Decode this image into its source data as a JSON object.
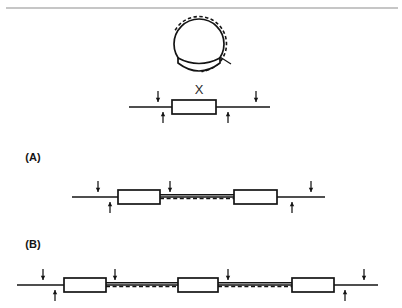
{
  "figure": {
    "title_rule_visible": true,
    "background_color": "#ffffff",
    "ink_color": "#141414",
    "rule_color": "#8d8d8d"
  },
  "panels": [
    {
      "id": "top",
      "label": "",
      "element_label": "X",
      "description": "circular donor molecule above a linear target strand carrying one inserted element"
    },
    {
      "id": "a",
      "label": "(A)",
      "description": "linear strand with two inserted elements joined by a duplex dashed segment"
    },
    {
      "id": "b",
      "label": "(B)",
      "description": "linear strand with three inserted elements joined by duplex dashed segments"
    }
  ],
  "labels": {
    "panel_a": "(A)",
    "panel_b": "(B)",
    "element_x": "X"
  },
  "chart_data": {
    "type": "diagram",
    "title": "",
    "top_rule": {
      "x1": 6,
      "x2": 398,
      "y": 8
    },
    "donor_circle": {
      "cx": 199,
      "cy": 44,
      "r_solid": 25,
      "r_dashed": 27.5,
      "dashed_arc_start_deg": -150,
      "dashed_arc_end_deg": 85,
      "nick_tick": {
        "x1": 220,
        "y1": 57,
        "x2": 231,
        "y2": 64
      },
      "crescent": {
        "left_x": 178,
        "right_x": 220,
        "top_y": 58,
        "bottom_y": 74
      }
    },
    "panels": [
      {
        "id": "top",
        "baseline_y": 107,
        "line_x1": 129,
        "line_x2": 270,
        "label": {
          "text": "X",
          "x": 199,
          "y": 94
        },
        "boxes": [
          {
            "x": 172,
            "y": 100,
            "w": 44,
            "h": 14
          }
        ],
        "duplex_segments": [],
        "arrows": [
          {
            "x": 158,
            "dir": "down",
            "side": "above"
          },
          {
            "x": 163,
            "dir": "up",
            "side": "below"
          },
          {
            "x": 228,
            "dir": "up",
            "side": "below"
          },
          {
            "x": 256,
            "dir": "down",
            "side": "above"
          }
        ]
      },
      {
        "id": "a",
        "baseline_y": 197,
        "line_x1": 72,
        "line_x2": 325,
        "label": {
          "text": "(A)",
          "x": 33,
          "y": 161
        },
        "boxes": [
          {
            "x": 118,
            "y": 190,
            "w": 42,
            "h": 14
          },
          {
            "x": 234,
            "y": 190,
            "w": 43,
            "h": 14
          }
        ],
        "duplex_segments": [
          {
            "x1": 160,
            "x2": 234
          }
        ],
        "arrows": [
          {
            "x": 98,
            "dir": "down",
            "side": "above"
          },
          {
            "x": 110,
            "dir": "up",
            "side": "below"
          },
          {
            "x": 170,
            "dir": "down",
            "side": "above"
          },
          {
            "x": 292,
            "dir": "up",
            "side": "below"
          },
          {
            "x": 311,
            "dir": "down",
            "side": "above"
          }
        ]
      },
      {
        "id": "b",
        "baseline_y": 285,
        "line_x1": 17,
        "line_x2": 378,
        "label": {
          "text": "(B)",
          "x": 33,
          "y": 248
        },
        "boxes": [
          {
            "x": 64,
            "y": 278,
            "w": 42,
            "h": 14
          },
          {
            "x": 178,
            "y": 278,
            "w": 40,
            "h": 14
          },
          {
            "x": 292,
            "y": 278,
            "w": 42,
            "h": 14
          }
        ],
        "duplex_segments": [
          {
            "x1": 106,
            "x2": 178
          },
          {
            "x1": 218,
            "x2": 292
          }
        ],
        "arrows": [
          {
            "x": 43,
            "dir": "down",
            "side": "above"
          },
          {
            "x": 55,
            "dir": "up",
            "side": "below"
          },
          {
            "x": 115,
            "dir": "down",
            "side": "above"
          },
          {
            "x": 228,
            "dir": "down",
            "side": "above"
          },
          {
            "x": 345,
            "dir": "up",
            "side": "below"
          },
          {
            "x": 364,
            "dir": "down",
            "side": "above"
          }
        ]
      }
    ]
  }
}
